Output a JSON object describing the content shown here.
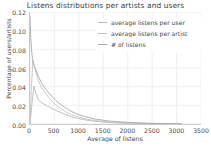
{
  "chart_data": {
    "type": "line",
    "title": "Listens distributions per artists and users",
    "xlabel": "Average of listens",
    "ylabel": "Percentage of users/artists",
    "xlim": [
      0,
      3500
    ],
    "ylim": [
      0.0,
      0.12
    ],
    "xticks": [
      0,
      500,
      1000,
      1500,
      2000,
      2500,
      3000,
      3500
    ],
    "xtick_labels": [
      "0",
      "500",
      "1000",
      "1500",
      "2000",
      "2500",
      "3000",
      "3500"
    ],
    "yticks": [
      0.0,
      0.02,
      0.04,
      0.06,
      0.08,
      0.1,
      0.12
    ],
    "ytick_labels": [
      "0.00",
      "0.02",
      "0.04",
      "0.06",
      "0.08",
      "0.10",
      "0.12"
    ],
    "grid": true,
    "grid_color": "#e6e6e6",
    "legend_position": "upper right",
    "series": [
      {
        "name": "average listens per user",
        "color": "#b8b8b8",
        "x": [
          0,
          40,
          80,
          120,
          170,
          220,
          280,
          340,
          400,
          470,
          540,
          620,
          700,
          800,
          900,
          1000,
          1150,
          1300,
          1500,
          1700,
          1900,
          2100,
          2400,
          2700,
          3000,
          3100
        ],
        "y": [
          0.0,
          0.0215,
          0.0405,
          0.033,
          0.0262,
          0.0235,
          0.0215,
          0.0198,
          0.018,
          0.0162,
          0.0145,
          0.0125,
          0.0108,
          0.0086,
          0.007,
          0.0058,
          0.0042,
          0.0031,
          0.002,
          0.0014,
          0.001,
          0.0008,
          0.0005,
          0.0003,
          0.0002,
          0.0002
        ]
      },
      {
        "name": "average listens per artist",
        "color": "#c4c4c4",
        "x": [
          0,
          30,
          60,
          100,
          150,
          200,
          260,
          320,
          400,
          480,
          560,
          650,
          750,
          850,
          950,
          1100,
          1250,
          1450,
          1650,
          1900,
          2150,
          2450,
          2750,
          3000,
          3100
        ],
        "y": [
          0.0,
          0.041,
          0.068,
          0.06,
          0.05,
          0.043,
          0.0372,
          0.0325,
          0.0272,
          0.0228,
          0.0192,
          0.0158,
          0.0125,
          0.01,
          0.0082,
          0.006,
          0.0045,
          0.003,
          0.0021,
          0.0013,
          0.0009,
          0.0005,
          0.0003,
          0.0002,
          0.0002
        ]
      },
      {
        "name": "# of listens",
        "color": "#a9a9a9",
        "x": [
          0,
          15,
          30,
          50,
          75,
          105,
          140,
          180,
          230,
          290,
          360,
          440,
          530,
          630,
          740,
          860,
          1000,
          1150,
          1350,
          1600,
          1850,
          2150,
          2500,
          2800,
          3050,
          3100
        ],
        "y": [
          0.1148,
          0.093,
          0.0805,
          0.07,
          0.064,
          0.06,
          0.0552,
          0.05,
          0.0448,
          0.0398,
          0.0348,
          0.03,
          0.0252,
          0.0208,
          0.0168,
          0.0132,
          0.01,
          0.0076,
          0.0052,
          0.0033,
          0.0022,
          0.0013,
          0.0007,
          0.0004,
          0.0002,
          0.0002
        ]
      }
    ]
  }
}
